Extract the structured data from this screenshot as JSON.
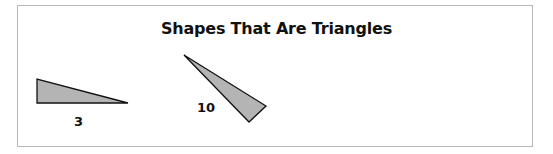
{
  "title": "Shapes That Are Triangles",
  "colors": {
    "fill": "#b4b4b4",
    "stroke": "#111111",
    "frame": "#b8b8b8"
  },
  "shapes": [
    {
      "type": "triangle",
      "points": "37,79 37,103 128,103",
      "label": "3"
    },
    {
      "type": "triangle",
      "points": "184,55 266,106 249,122",
      "label": "10"
    }
  ]
}
